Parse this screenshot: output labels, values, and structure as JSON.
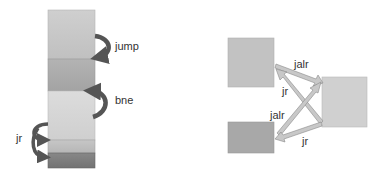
{
  "left_diagram": {
    "title": "Linear code layout with jumps",
    "blocks": [
      {
        "name": "block-1",
        "color": "#c8c8c8"
      },
      {
        "name": "block-2",
        "color": "#a9a9a9"
      },
      {
        "name": "block-3",
        "color": "#d6d6d6"
      },
      {
        "name": "block-4",
        "color": "#bdbdbd"
      },
      {
        "name": "block-5",
        "color": "#7c7c7c"
      }
    ],
    "arrows": [
      {
        "label": "jump",
        "from": "block-1",
        "to": "block-2"
      },
      {
        "label": "bne",
        "from": "block-3",
        "to": "block-2"
      },
      {
        "label": "jr",
        "from": "block-3",
        "to": [
          "block-4",
          "block-5"
        ]
      }
    ]
  },
  "right_diagram": {
    "title": "Blocks connected by indirect jumps",
    "blocks": [
      {
        "name": "top-left-block",
        "color": "#c2c2c2"
      },
      {
        "name": "bottom-left-block",
        "color": "#a8a8a8"
      },
      {
        "name": "right-block",
        "color": "#d0d0d0"
      }
    ],
    "arrows": [
      {
        "label": "jalr",
        "from": "top-left-block",
        "to": "right-block"
      },
      {
        "label": "jr",
        "from": "right-block",
        "to": "top-left-block"
      },
      {
        "label": "jalr",
        "from": "bottom-left-block",
        "to": "right-block"
      },
      {
        "label": "jr",
        "from": "right-block",
        "to": "bottom-left-block"
      }
    ]
  },
  "colors": {
    "arrow_dark": "#555555",
    "arrow_light_fill": "#c8c8c8",
    "arrow_light_stroke": "#8a8a8a",
    "label": "#333333"
  }
}
